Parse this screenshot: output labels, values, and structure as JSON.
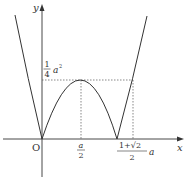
{
  "figure": {
    "axes": {
      "x_label": "x",
      "y_label": "y",
      "origin_label": "O"
    },
    "annotations": {
      "peak_y_frac_num": "1",
      "peak_y_frac_den": "4",
      "peak_y_suffix": "a",
      "peak_y_exp": "2",
      "peak_x_num": "a",
      "peak_x_den": "2",
      "cross_x_num": "1+√2",
      "cross_x_den": "2",
      "cross_x_suffix": "a"
    },
    "colors": {
      "curve": "#333333",
      "axis": "#333333",
      "guide": "#555555",
      "background": "#ffffff"
    }
  }
}
